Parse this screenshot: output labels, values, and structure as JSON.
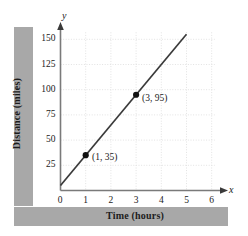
{
  "figure": {
    "axis_var_x": "x",
    "axis_var_y": "y"
  },
  "chart_data": {
    "type": "line",
    "title": "",
    "xlabel": "Time (hours)",
    "ylabel": "Distance (miles)",
    "xlim": [
      0,
      6
    ],
    "ylim": [
      0,
      150
    ],
    "xticks": [
      "0",
      "1",
      "2",
      "3",
      "4",
      "5",
      "6"
    ],
    "xtick_values": [
      0,
      1,
      2,
      3,
      4,
      5,
      6
    ],
    "yticks": [
      "0",
      "25",
      "50",
      "75",
      "100",
      "125",
      "150"
    ],
    "ytick_values": [
      0,
      25,
      50,
      75,
      100,
      125,
      150
    ],
    "grid": true,
    "legend": "none",
    "series": [
      {
        "name": "distance",
        "line_from": [
          0,
          5
        ],
        "line_to": [
          5,
          155
        ],
        "slope": 30,
        "intercept": 5,
        "x": [
          1,
          3
        ],
        "values": [
          35,
          95
        ],
        "marker_labels": [
          "(1, 35)",
          "(3, 95)"
        ]
      }
    ],
    "annotations": [
      {
        "text": "(1, 35)",
        "x": 1,
        "y": 35
      },
      {
        "text": "(3, 95)",
        "x": 3,
        "y": 95
      }
    ],
    "colors": {
      "line": "#3a3a3a",
      "marker": "#111111",
      "grid": "#e2e2e2",
      "axis": "#6e6e6e",
      "band": "#a8a8a8"
    }
  }
}
